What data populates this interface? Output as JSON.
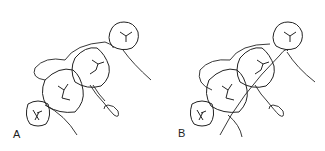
{
  "figure": {
    "panels": [
      {
        "label": "A",
        "description": "Row of teeth with ligature wire looped around, twisted end at lower right"
      },
      {
        "label": "B",
        "description": "Row of teeth with ligature wire crossing over, twisted end at lower right"
      }
    ],
    "colors": {
      "line": "#222222",
      "background": "#ffffff"
    }
  }
}
